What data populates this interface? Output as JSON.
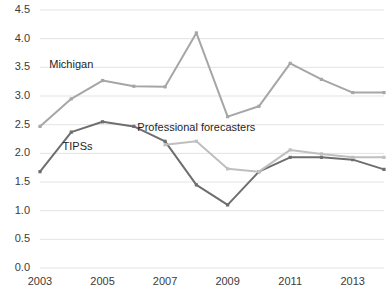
{
  "chart_data": {
    "type": "line",
    "title": "",
    "subtitle": "",
    "xlabel": "",
    "ylabel": "",
    "xlim": [
      2003,
      2014
    ],
    "ylim": [
      0.0,
      4.5
    ],
    "grid": true,
    "grid_axis": "y",
    "legend_position": "inline-annotations",
    "x": [
      2003,
      2004,
      2005,
      2006,
      2007,
      2008,
      2009,
      2010,
      2011,
      2012,
      2013,
      2014
    ],
    "xticks": [
      "2003",
      "2005",
      "2007",
      "2009",
      "2011",
      "2013"
    ],
    "xtick_values": [
      2003,
      2005,
      2007,
      2009,
      2011,
      2013
    ],
    "yticks": [
      "0.0",
      "0.5",
      "1.0",
      "1.5",
      "2.0",
      "2.5",
      "3.0",
      "3.5",
      "4.0",
      "4.5"
    ],
    "ytick_values": [
      0.0,
      0.5,
      1.0,
      1.5,
      2.0,
      2.5,
      3.0,
      3.5,
      4.0,
      4.5
    ],
    "series": [
      {
        "name": "Michigan",
        "color": "#a6a6a6",
        "label_x": 2004.0,
        "label_y": 3.52,
        "x": [
          2003,
          2004,
          2005,
          2006,
          2007,
          2008,
          2009,
          2010,
          2011,
          2012,
          2013,
          2014
        ],
        "values": [
          2.47,
          2.95,
          3.27,
          3.17,
          3.16,
          4.1,
          2.64,
          2.82,
          3.57,
          3.29,
          3.06,
          3.06
        ]
      },
      {
        "name": "TIPSs",
        "color": "#6e6e6e",
        "label_x": 2004.2,
        "label_y": 2.1,
        "x": [
          2003,
          2004,
          2005,
          2006,
          2007,
          2008,
          2009,
          2010,
          2011,
          2012,
          2013,
          2014
        ],
        "values": [
          1.68,
          2.37,
          2.55,
          2.47,
          2.21,
          1.45,
          1.1,
          1.68,
          1.93,
          1.93,
          1.89,
          1.72
        ]
      },
      {
        "name": "Professional forecasters",
        "color": "#bfbfbf",
        "label_x": 2008.0,
        "label_y": 2.42,
        "x": [
          2007,
          2008,
          2009,
          2010,
          2011,
          2012,
          2013,
          2014
        ],
        "values": [
          2.15,
          2.21,
          1.73,
          1.68,
          2.06,
          1.99,
          1.93,
          1.93
        ]
      }
    ]
  },
  "axes": {
    "y_tick_labels": [
      "4.5",
      "4.0",
      "3.5",
      "3.0",
      "2.5",
      "2.0",
      "1.5",
      "1.0",
      "0.5",
      "0.0"
    ],
    "x_tick_labels": [
      "2003",
      "2005",
      "2007",
      "2009",
      "2011",
      "2013"
    ]
  },
  "annotations": {
    "michigan": "Michigan",
    "tipss": "TIPSs",
    "professional_forecasters": "Professional forecasters"
  },
  "colors": {
    "michigan": "#a6a6a6",
    "tipss": "#6e6e6e",
    "professional_forecasters": "#bfbfbf",
    "gridline": "#e3e3e3",
    "text": "#3b3b3b",
    "background": "#ffffff"
  }
}
